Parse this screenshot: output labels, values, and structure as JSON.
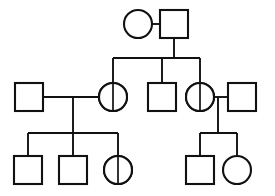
{
  "figure": {
    "type": "pedigree-chart",
    "title": "",
    "background_color": "#ffffff",
    "line_color": "#111111",
    "hatch_color": "#111111",
    "width": 275,
    "height": 196
  },
  "legend": {
    "square_meaning": "male",
    "circle_meaning": "female",
    "unfilled_meaning": "unaffected",
    "fully_hatched_meaning": "affected",
    "half_hatched_meaning": "carrier"
  },
  "generations": [
    {
      "id": "I",
      "label": "I",
      "y": 24,
      "individuals": [
        {
          "id": "I-1",
          "sex": "female",
          "shape": "circle",
          "status": "unaffected",
          "fill": "none",
          "cx": 138,
          "cy": 24,
          "r": 14
        },
        {
          "id": "I-2",
          "sex": "male",
          "shape": "square",
          "status": "affected",
          "fill": "full-hatch",
          "x": 160,
          "y": 10,
          "size": 28
        }
      ],
      "matings": [
        {
          "id": "mating-I",
          "partners": [
            "I-1",
            "I-2"
          ],
          "line_y": 24,
          "x1": 152,
          "x2": 160,
          "descent_x": 174,
          "descent_y1": 24,
          "descent_y2": 58
        }
      ]
    },
    {
      "id": "II",
      "label": "II",
      "y": 97,
      "sibship_line": {
        "y": 58,
        "x1": 113,
        "x2": 200
      },
      "individuals": [
        {
          "id": "II-1",
          "sex": "male",
          "shape": "square",
          "status": "unaffected",
          "fill": "none",
          "x": 15,
          "y": 83,
          "size": 28,
          "married_in": true
        },
        {
          "id": "II-2",
          "sex": "female",
          "shape": "circle",
          "status": "carrier",
          "fill": "half-hatch",
          "cx": 113,
          "cy": 97,
          "r": 14,
          "drop_x": 113,
          "drop_y1": 58,
          "drop_y2": 83
        },
        {
          "id": "II-3",
          "sex": "male",
          "shape": "square",
          "status": "unaffected",
          "fill": "none",
          "x": 148,
          "y": 83,
          "size": 28,
          "drop_x": 162,
          "drop_y1": 58,
          "drop_y2": 83
        },
        {
          "id": "II-4",
          "sex": "female",
          "shape": "circle",
          "status": "carrier",
          "fill": "half-hatch",
          "cx": 200,
          "cy": 97,
          "r": 14,
          "drop_x": 200,
          "drop_y1": 58,
          "drop_y2": 83
        },
        {
          "id": "II-5",
          "sex": "male",
          "shape": "square",
          "status": "unaffected",
          "fill": "none",
          "x": 228,
          "y": 83,
          "size": 28,
          "married_in": true
        }
      ],
      "matings": [
        {
          "id": "mating-II-left",
          "partners": [
            "II-1",
            "II-2"
          ],
          "line_y": 97,
          "x1": 43,
          "x2": 99,
          "descent_x": 73,
          "descent_y1": 97,
          "descent_y2": 133
        },
        {
          "id": "mating-II-right",
          "partners": [
            "II-4",
            "II-5"
          ],
          "line_y": 97,
          "x1": 214,
          "x2": 228,
          "descent_x": 218,
          "descent_y1": 97,
          "descent_y2": 133
        }
      ]
    },
    {
      "id": "III",
      "label": "III",
      "y": 170,
      "sibship_lines": [
        {
          "id": "sib-III-left",
          "y": 133,
          "x1": 28,
          "x2": 118
        },
        {
          "id": "sib-III-right",
          "y": 133,
          "x1": 200,
          "x2": 237
        }
      ],
      "individuals": [
        {
          "id": "III-1",
          "sex": "male",
          "shape": "square",
          "status": "affected",
          "fill": "full-hatch",
          "x": 14,
          "y": 156,
          "size": 28,
          "drop_x": 28,
          "drop_y1": 133,
          "drop_y2": 156
        },
        {
          "id": "III-2",
          "sex": "male",
          "shape": "square",
          "status": "unaffected",
          "fill": "none",
          "x": 59,
          "y": 156,
          "size": 28,
          "drop_x": 73,
          "drop_y1": 133,
          "drop_y2": 156
        },
        {
          "id": "III-3",
          "sex": "female",
          "shape": "circle",
          "status": "carrier",
          "fill": "half-hatch",
          "cx": 118,
          "cy": 170,
          "r": 14,
          "drop_x": 118,
          "drop_y1": 133,
          "drop_y2": 156
        },
        {
          "id": "III-4",
          "sex": "male",
          "shape": "square",
          "status": "affected",
          "fill": "full-hatch",
          "x": 186,
          "y": 156,
          "size": 28,
          "drop_x": 200,
          "drop_y1": 133,
          "drop_y2": 156
        },
        {
          "id": "III-5",
          "sex": "female",
          "shape": "circle",
          "status": "unaffected",
          "fill": "none",
          "cx": 237,
          "cy": 170,
          "r": 14,
          "drop_x": 237,
          "drop_y1": 133,
          "drop_y2": 156
        }
      ]
    }
  ],
  "counts": {
    "total_individuals": 12,
    "affected_males": 3,
    "carrier_females": 3,
    "unaffected_males": 4,
    "unaffected_females": 2
  }
}
